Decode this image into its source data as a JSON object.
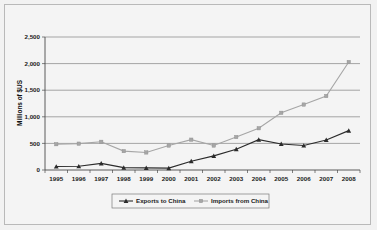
{
  "chart_data": {
    "type": "line",
    "title": "",
    "xlabel": "",
    "ylabel": "Millions of $US",
    "categories": [
      "1995",
      "1996",
      "1997",
      "1998",
      "1999",
      "2000",
      "2001",
      "2002",
      "2003",
      "2004",
      "2005",
      "2006",
      "2007",
      "2008"
    ],
    "ylim": [
      0,
      2500
    ],
    "yticks": [
      0,
      500,
      1000,
      1500,
      2000,
      2500
    ],
    "ytick_labels": [
      "0",
      "500",
      "1,000",
      "1,500",
      "2,000",
      "2,500"
    ],
    "grid": true,
    "legend_position": "bottom",
    "series": [
      {
        "name": "Exports to China",
        "color": "#2b2b2b",
        "marker": "triangle",
        "values": [
          65,
          70,
          125,
          45,
          40,
          35,
          165,
          265,
          390,
          570,
          490,
          460,
          565,
          740
        ]
      },
      {
        "name": "Imports from China",
        "color": "#a6a6a6",
        "marker": "square",
        "values": [
          485,
          495,
          530,
          355,
          330,
          460,
          570,
          460,
          620,
          785,
          1075,
          1230,
          1390,
          2030
        ]
      }
    ]
  },
  "axis": {
    "y_title": "Millions of $US"
  },
  "legend": {
    "items": [
      {
        "label": "Exports to China"
      },
      {
        "label": "Imports from China"
      }
    ]
  },
  "colors": {
    "exports": "#2b2b2b",
    "imports": "#a6a6a6",
    "grid": "#6e6e6e",
    "frame": "#b9b9b9",
    "background": "#f2f2f2"
  }
}
